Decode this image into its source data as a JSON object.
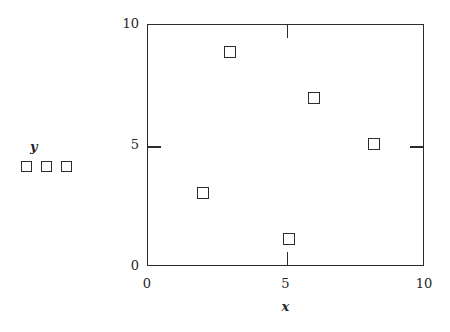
{
  "chart_data": {
    "type": "scatter",
    "title": "",
    "xlabel": "x",
    "ylabel": "y",
    "xlim": [
      0,
      10
    ],
    "ylim": [
      0,
      10
    ],
    "grid": false,
    "marker": "open-square",
    "x_ticks": [
      {
        "value": 0,
        "label": "0"
      },
      {
        "value": 5,
        "label": "5"
      },
      {
        "value": 10,
        "label": "10"
      }
    ],
    "y_ticks": [
      {
        "value": 0,
        "label": "0"
      },
      {
        "value": 5,
        "label": "5"
      },
      {
        "value": 10,
        "label": "10"
      }
    ],
    "series": [
      {
        "name": "y",
        "marker": "open-square",
        "color": "#2b2b2b",
        "points": [
          {
            "x": 2.0,
            "y": 3.05
          },
          {
            "x": 2.95,
            "y": 8.9
          },
          {
            "x": 5.1,
            "y": 1.15
          },
          {
            "x": 6.0,
            "y": 7.0
          },
          {
            "x": 8.15,
            "y": 5.1
          }
        ]
      }
    ]
  },
  "legend": {
    "title": "y",
    "swatch_count": 3,
    "swatches": [
      {
        "name": "swatch-1",
        "marker": "open-square"
      },
      {
        "name": "swatch-2",
        "marker": "open-square"
      },
      {
        "name": "swatch-3",
        "marker": "open-square"
      }
    ]
  },
  "axes": {
    "x_title": "x",
    "y_title": "y",
    "frame_color": "#2b2b2b",
    "background": "#ffffff"
  }
}
